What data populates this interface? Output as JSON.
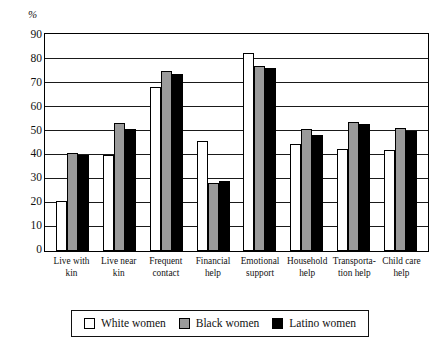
{
  "chart_data": {
    "type": "bar",
    "title": "",
    "xlabel": "",
    "ylabel": "%",
    "ylim": [
      0,
      90
    ],
    "ytick_step": 10,
    "yticks": [
      90,
      80,
      70,
      60,
      50,
      40,
      30,
      20,
      10,
      0
    ],
    "grid": true,
    "legend_position": "bottom",
    "categories": [
      "Live with kin",
      "Live near kin",
      "Frequent contact",
      "Financial help",
      "Emotional support",
      "Household help",
      "Transportation help",
      "Child care help"
    ],
    "category_lines": [
      [
        "Live with",
        "kin"
      ],
      [
        "Live near",
        "kin"
      ],
      [
        "Frequent",
        "contact"
      ],
      [
        "Financial",
        "help"
      ],
      [
        "Emotional",
        "support"
      ],
      [
        "Household",
        "help"
      ],
      [
        "Transporta-",
        "tion help"
      ],
      [
        "Child care",
        "help"
      ]
    ],
    "series": [
      {
        "name": "White women",
        "color": "#ffffff",
        "values": [
          21,
          40,
          68.5,
          46,
          82.5,
          44.5,
          42.5,
          42
        ]
      },
      {
        "name": "Black women",
        "color": "#9a9a9a",
        "values": [
          41,
          53.5,
          75,
          28.5,
          77,
          51,
          54,
          51.5
        ]
      },
      {
        "name": "Latino women",
        "color": "#000000",
        "values": [
          40,
          51,
          74,
          29,
          76.5,
          48.5,
          53,
          50
        ]
      }
    ]
  },
  "legend": {
    "items": [
      {
        "label": "White women",
        "swatch": "white"
      },
      {
        "label": "Black women",
        "swatch": "gray"
      },
      {
        "label": "Latino women",
        "swatch": "black"
      }
    ]
  }
}
